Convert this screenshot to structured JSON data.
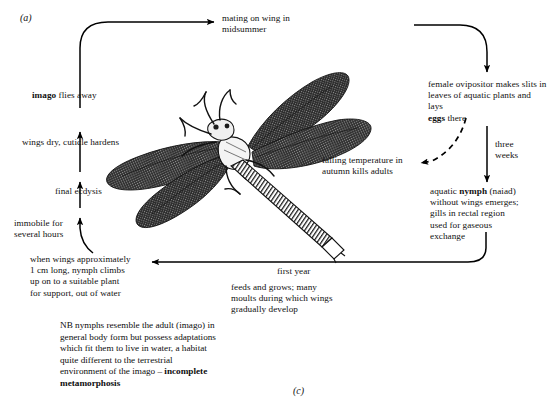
{
  "figure": {
    "panel_label_top": "(a)",
    "panel_label_bottom": "(c)",
    "title_semantic": "dragonfly life cycle — incomplete metamorphosis"
  },
  "nodes": {
    "mating": "mating on wing in\nmidsummer",
    "ovipositor": "female ovipositor makes\nslits in leaves of\naquatic plants and lays",
    "ovipositor_bold": "eggs",
    "ovipositor_tail": " there",
    "three_weeks": "three\nweeks",
    "nymph_prefix": "aquatic ",
    "nymph_bold": "nymph",
    "nymph_rest": " (naiad)\nwithout wings emerges;\ngills in rectal region\nused for gaseous\nexchange",
    "first_year": "first year",
    "feeds": "feeds and grows; many\nmoults during which wings\ngradually develop",
    "when_wings": "when wings approximately\n1 cm long, nymph climbs\nup on to a suitable plant\nfor support, out of water",
    "immobile": "immobile for\nseveral hours",
    "final_ecdysis": "final ecdysis",
    "wings_dry": "wings dry, cuticle hardens",
    "imago_bold": "imago",
    "imago_rest": " flies away",
    "falling_temp": "falling temperature in\nautumn kills adults"
  },
  "note": {
    "line1_plain": "NB nymphs resemble the adult (imago) in",
    "line2_plain": "general body form but possess adaptations",
    "line3_plain": "which fit them to live in water, a habitat",
    "line4_plain": "quite different to the terrestrial",
    "line5_plain": "environment of the imago – ",
    "line5_bold": "incomplete",
    "line6_bold": "metamorphosis"
  },
  "colors": {
    "ink": "#111111",
    "arrow": "#000000",
    "background": "#ffffff"
  },
  "illustration": {
    "name": "dragonfly-adult",
    "caption": "line drawing of an adult dragonfly with four hatched wings and a long banded abdomen"
  }
}
